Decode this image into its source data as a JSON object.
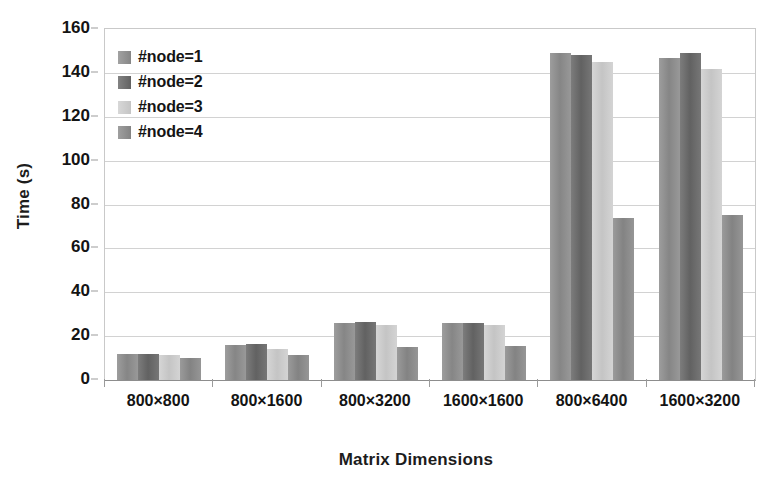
{
  "chart_data": {
    "type": "bar",
    "title": "",
    "xlabel": "Matrix Dimensions",
    "ylabel": "Time (s)",
    "ylim": [
      0,
      160
    ],
    "ytick_step": 20,
    "yticks": [
      160,
      140,
      120,
      100,
      80,
      60,
      40,
      20,
      0
    ],
    "grid": "horizontal",
    "legend_position": "upper-left-inside",
    "categories": [
      "800×800",
      "800×1600",
      "800×3200",
      "1600×1600",
      "800×6400",
      "1600×3200"
    ],
    "series": [
      {
        "name": "#node=1",
        "color": "#8d8d8d",
        "values": [
          12,
          16,
          26,
          26,
          149,
          147
        ]
      },
      {
        "name": "#node=2",
        "color": "#676767",
        "values": [
          12,
          16.5,
          26.5,
          26,
          148,
          149
        ]
      },
      {
        "name": "#node=3",
        "color": "#cfcfcf",
        "values": [
          11.5,
          14,
          25,
          25,
          145,
          142
        ]
      },
      {
        "name": "#node=4",
        "color": "#8a8a8a",
        "values": [
          10,
          11.5,
          15,
          15.5,
          74,
          75
        ]
      }
    ]
  },
  "axes": {
    "y_title": "Time (s)",
    "x_title": "Matrix Dimensions"
  }
}
